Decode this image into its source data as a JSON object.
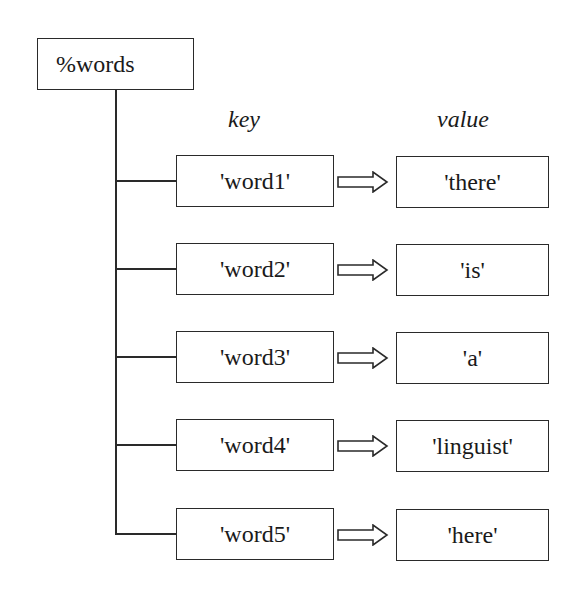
{
  "root": {
    "label": "%words"
  },
  "headers": {
    "key": "key",
    "value": "value"
  },
  "entries": [
    {
      "key": "'word1'",
      "value": "'there'"
    },
    {
      "key": "'word2'",
      "value": "'is'"
    },
    {
      "key": "'word3'",
      "value": "'a'"
    },
    {
      "key": "'word4'",
      "value": "'linguist'"
    },
    {
      "key": "'word5'",
      "value": "'here'"
    }
  ],
  "colors": {
    "stroke": "#2a2a2a",
    "background": "#ffffff"
  }
}
